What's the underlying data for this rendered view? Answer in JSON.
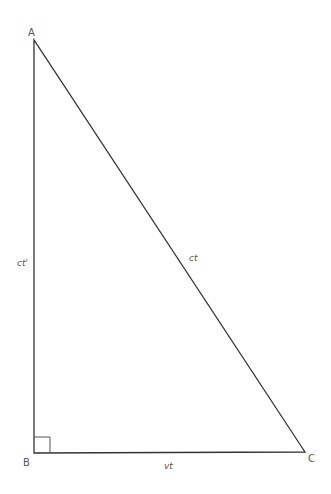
{
  "diagram": {
    "type": "right-triangle",
    "stroke_color": "#333333",
    "label_color": "#555555",
    "vertices": {
      "A": {
        "label": "A",
        "x": 34,
        "y": 40
      },
      "B": {
        "label": "B",
        "x": 34,
        "y": 453
      },
      "C": {
        "label": "C",
        "x": 305,
        "y": 452
      }
    },
    "edges": {
      "AB": {
        "label": "ct'"
      },
      "AC": {
        "label": "ct"
      },
      "BC": {
        "label": "vt"
      }
    },
    "right_angle_at": "B"
  }
}
